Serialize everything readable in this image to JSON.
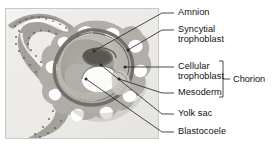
{
  "figure": {
    "type": "labeled-micrograph",
    "panel": {
      "name": "histology-micrograph",
      "border_color": "#c8c8c8",
      "background_color": "#f2f1ef"
    }
  },
  "labels": [
    {
      "id": "amnion",
      "text": "Amnion",
      "x": 178,
      "y": 9,
      "dash_x1": 162,
      "dash_x2": 174,
      "dash_y": 13,
      "leader": {
        "x1": 162,
        "y1": 13,
        "x2": 93,
        "y2": 52
      }
    },
    {
      "id": "syncytial-trophoblast",
      "text": "Syncytial\ntrophoblast",
      "x": 178,
      "y": 26,
      "dash_x1": 162,
      "dash_x2": 174,
      "dash_y": 30,
      "leader": {
        "x1": 162,
        "y1": 30,
        "x2": 127,
        "y2": 49
      }
    },
    {
      "id": "cellular-trophoblast",
      "text": "Cellular\ntrophoblast",
      "x": 178,
      "y": 63,
      "dash_x1": 162,
      "dash_x2": 174,
      "dash_y": 67,
      "leader": {
        "x1": 162,
        "y1": 67,
        "x2": 123,
        "y2": 68
      }
    },
    {
      "id": "mesoderm",
      "text": "Mesoderm",
      "x": 178,
      "y": 89,
      "dash_x1": 162,
      "dash_x2": 174,
      "dash_y": 93,
      "leader": {
        "x1": 162,
        "y1": 93,
        "x2": 117,
        "y2": 78
      }
    },
    {
      "id": "yolk-sac",
      "text": "Yolk sac",
      "x": 178,
      "y": 110,
      "dash_x1": 162,
      "dash_x2": 174,
      "dash_y": 114,
      "leader": {
        "x1": 162,
        "y1": 114,
        "x2": 102,
        "y2": 65
      }
    },
    {
      "id": "blastocoele",
      "text": "Blastocoele",
      "x": 178,
      "y": 128,
      "dash_x1": 162,
      "dash_x2": 174,
      "dash_y": 132,
      "leader": {
        "x1": 162,
        "y1": 132,
        "x2": 88,
        "y2": 79
      }
    }
  ],
  "bracket": {
    "label": "Chorion",
    "label_x": 235,
    "label_y": 75,
    "x": 222,
    "y_top": 62,
    "y_bottom": 97,
    "tick_x2": 231,
    "tick_y": 79
  },
  "colors": {
    "text": "#111111",
    "leader_line": "#2b2b2b",
    "panel_border": "#c8c8c8",
    "panel_background": "#f2f1ef",
    "tissue_light": "#e3e1dd",
    "tissue_mid": "#c5c2bc",
    "tissue_dark": "#8e8b85",
    "tissue_darkest": "#6d6a65",
    "lacuna_white": "#ffffff"
  }
}
